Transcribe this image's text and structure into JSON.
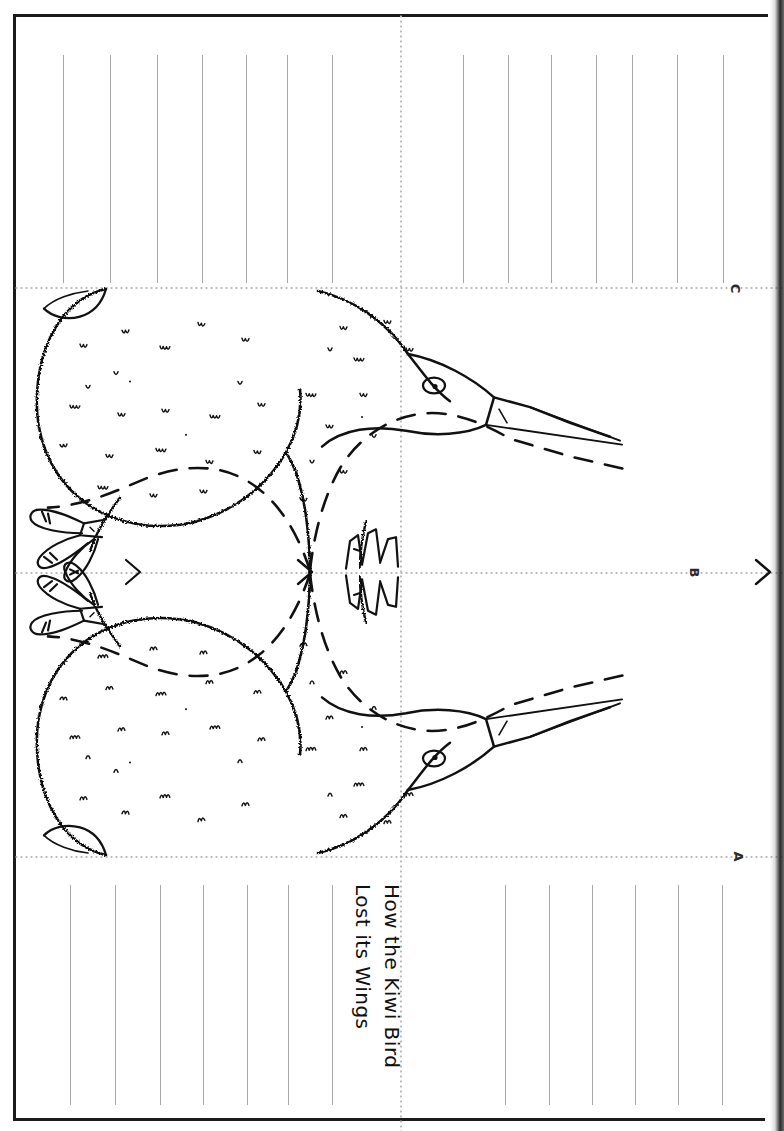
{
  "document": {
    "kind": "printable-foldable-worksheet",
    "title_line_1": "How the Kiwi Bird",
    "title_line_2": "Lost its Wings",
    "orientation_note": "text-rotated-90-degrees",
    "subject": "kiwi-bird-story-craft"
  },
  "corner_labels": [
    {
      "id": "label-a",
      "text": "A"
    },
    {
      "id": "label-b",
      "text": "B"
    },
    {
      "id": "label-c",
      "text": "C"
    }
  ],
  "colors": {
    "ink": "#111111",
    "frame": "#1b1b1b",
    "rule_line": "#a9a9a9",
    "fold_guide": "#b9b9b9",
    "paper": "#ffffff",
    "binding_shadow": "#191919"
  },
  "panels": {
    "top_writing_panel": {
      "name": "top-writing-panel",
      "rule_count_left": 7,
      "rule_count_right": 7,
      "rules_total": 14
    },
    "artwork_panel": {
      "name": "kiwi-artwork-panel",
      "description": "two mirrored kiwi birds meeting beak-to-beak at centre, solid outlines with dashed cut lines",
      "bird_count": 2,
      "features": [
        "long-pointed-beak",
        "round-eye",
        "feather-squiggle-texture",
        "three-toed-clawed-feet",
        "shaggy-body-outline"
      ]
    },
    "bottom_writing_panel": {
      "name": "bottom-writing-panel",
      "rule_count_left": 7,
      "rule_count_right": 6,
      "rules_total": 13,
      "contains_title": true
    }
  },
  "guides": {
    "horizontal_folds": 3,
    "vertical_folds": 1,
    "style": "dotted"
  }
}
